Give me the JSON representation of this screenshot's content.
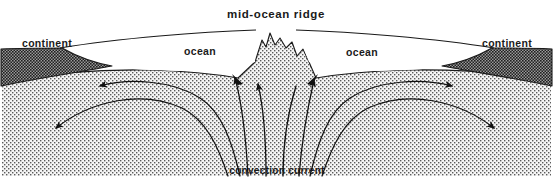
{
  "figure": {
    "type": "cross-section-diagram",
    "width": 553,
    "height": 193
  },
  "labels": {
    "title": "mid-ocean  ridge",
    "continent_left": "continent",
    "continent_right": "continent",
    "ocean_left": "ocean",
    "ocean_right": "ocean",
    "convection_current": "convection  current"
  },
  "colors": {
    "background": "#ffffff",
    "outline": "#1a1a1a",
    "text": "#1a1a1a",
    "mantle_fill": "#f2f2f2",
    "mantle_stipple": "#555555",
    "continent_fill": "#808080",
    "continent_stipple": "#2b2b2b",
    "ocean_fill": "#ffffff",
    "arrow": "#111111"
  },
  "regions": [
    {
      "name": "mantle",
      "label": "",
      "texture": "fine-stipple-light"
    },
    {
      "name": "continent-left",
      "label": "continent",
      "texture": "dense-stipple-dark"
    },
    {
      "name": "continent-right",
      "label": "continent",
      "texture": "dense-stipple-dark"
    },
    {
      "name": "ocean-basin-left",
      "label": "ocean",
      "texture": "blank-white"
    },
    {
      "name": "ocean-basin-right",
      "label": "ocean",
      "texture": "blank-white"
    },
    {
      "name": "mid-ocean-ridge",
      "label": "mid-ocean  ridge",
      "texture": "fine-stipple-light"
    }
  ],
  "flow_arrows": [
    {
      "name": "upwelling-center-left",
      "direction": "up",
      "side": "left"
    },
    {
      "name": "upwelling-center-right",
      "direction": "up",
      "side": "right"
    },
    {
      "name": "upwelling-inner-left",
      "direction": "up-left",
      "side": "left"
    },
    {
      "name": "upwelling-inner-right",
      "direction": "up-right",
      "side": "right"
    },
    {
      "name": "outflow-upper-left",
      "direction": "left",
      "side": "left"
    },
    {
      "name": "outflow-upper-right",
      "direction": "right",
      "side": "right"
    },
    {
      "name": "outflow-lower-left",
      "direction": "down-left",
      "side": "left"
    },
    {
      "name": "outflow-lower-right",
      "direction": "down-right",
      "side": "right"
    }
  ]
}
